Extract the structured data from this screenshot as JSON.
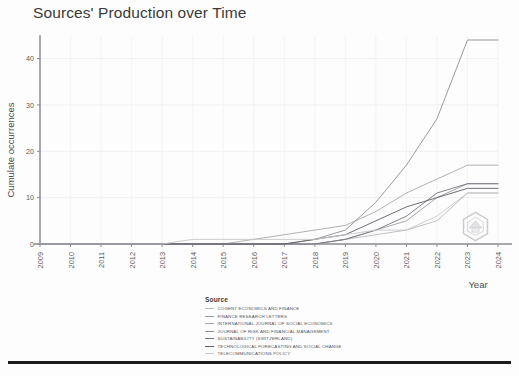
{
  "chart_data": {
    "type": "line",
    "title": "Sources' Production over Time",
    "xlabel": "Year",
    "ylabel": "Cumulate occurrences",
    "x": [
      2009,
      2010,
      2011,
      2012,
      2013,
      2014,
      2015,
      2016,
      2017,
      2018,
      2019,
      2020,
      2021,
      2022,
      2023,
      2024
    ],
    "xlim": [
      2009,
      2024
    ],
    "ylim": [
      0,
      44
    ],
    "yticks": [
      0,
      10,
      20,
      30,
      40
    ],
    "xticks": [
      "2009",
      "2010",
      "2011",
      "2012",
      "2013",
      "2014",
      "2015",
      "2016",
      "2017",
      "2018",
      "2019",
      "2020",
      "2021",
      "2022",
      "2023",
      "2024"
    ],
    "grid": true,
    "legend_position": "bottom",
    "legend_title": "Source",
    "series": [
      {
        "name": "COGENT ECONOMICS AND FINANCE",
        "color": "#b9b9bd",
        "values": [
          0,
          0,
          0,
          0,
          0,
          0,
          0,
          0,
          0,
          0,
          1,
          2,
          3,
          5,
          11,
          11
        ]
      },
      {
        "name": "FINANCE RESEARCH LETTERS",
        "color": "#9c9ca2",
        "values": [
          0,
          0,
          0,
          0,
          0,
          0,
          0,
          0,
          0,
          0,
          1,
          3,
          5,
          10,
          13,
          13
        ]
      },
      {
        "name": "INTERNATIONAL JOURNAL OF SOCIAL ECONOMICS",
        "color": "#a8a8ae",
        "values": [
          0,
          0,
          0,
          0,
          0,
          0,
          0,
          1,
          2,
          3,
          4,
          7,
          11,
          14,
          17,
          17
        ]
      },
      {
        "name": "JOURNAL OF RISK AND FINANCIAL MANAGEMENT",
        "color": "#8e8e95",
        "values": [
          0,
          0,
          0,
          0,
          0,
          0,
          0,
          0,
          0,
          1,
          3,
          9,
          17,
          27,
          44,
          44
        ]
      },
      {
        "name": "SUSTAINABILITY (SWITZERLAND)",
        "color": "#767680",
        "values": [
          0,
          0,
          0,
          0,
          0,
          0,
          0,
          0,
          0,
          0,
          1,
          3,
          6,
          11,
          13,
          13
        ]
      },
      {
        "name": "TECHNOLOGICAL FORECASTING AND SOCIAL CHANGE",
        "color": "#5e5e68",
        "values": [
          0,
          0,
          0,
          0,
          0,
          0,
          0,
          0,
          0,
          1,
          2,
          5,
          8,
          10,
          12,
          12
        ]
      },
      {
        "name": "TELECOMMUNICATIONS POLICY",
        "color": "#c6c6ca",
        "values": [
          0,
          0,
          0,
          0,
          0,
          1,
          1,
          1,
          1,
          1,
          2,
          3,
          3,
          6,
          11,
          11
        ]
      }
    ]
  },
  "watermark": {
    "name": "hexagon-logo-watermark"
  }
}
